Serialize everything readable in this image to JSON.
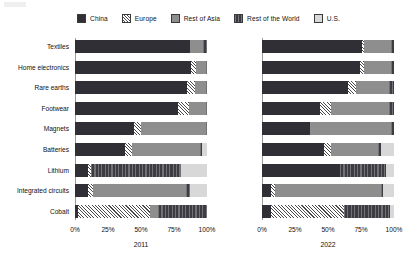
{
  "legend": {
    "position": "top-center",
    "items": [
      {
        "label": "China",
        "key": "china",
        "color": "#2f2f35"
      },
      {
        "label": "Europe",
        "key": "europe",
        "color": "#ffffff"
      },
      {
        "label": "Rest of Asia",
        "key": "roa",
        "color": "#8e8e8e"
      },
      {
        "label": "Rest of the World",
        "key": "row",
        "color": "#3c3c42"
      },
      {
        "label": "U.S.",
        "key": "us",
        "color": "#d8d8d8"
      }
    ]
  },
  "axis": {
    "ticks": [
      "0%",
      "25%",
      "50%",
      "75%",
      "100%"
    ],
    "tick_values": [
      0,
      25,
      50,
      75,
      100
    ],
    "min": 0,
    "max": 100
  },
  "panels": [
    {
      "id": "panel-2011",
      "title": "2011"
    },
    {
      "id": "panel-2022",
      "title": "2022"
    }
  ],
  "chart_data": {
    "type": "bar",
    "orientation": "horizontal",
    "stacked": true,
    "normalized_percent": true,
    "title": "",
    "subtitle": "",
    "xlabel": "",
    "ylabel": "",
    "xlim": [
      0,
      100
    ],
    "grid": false,
    "legend_position": "top-center",
    "series": [
      {
        "name": "China",
        "key": "china"
      },
      {
        "name": "Europe",
        "key": "europe"
      },
      {
        "name": "Rest of Asia",
        "key": "roa"
      },
      {
        "name": "Rest of the World",
        "key": "row"
      },
      {
        "name": "U.S.",
        "key": "us"
      }
    ],
    "categories": [
      "Textiles",
      "Home electronics",
      "Rare earths",
      "Footwear",
      "Magnets",
      "Batteries",
      "Lithium",
      "Integrated circuits",
      "Cobalt"
    ],
    "panels": [
      {
        "name": "2011",
        "rows": [
          {
            "category": "Textiles",
            "china": 87,
            "europe": 0,
            "roa": 10,
            "row": 3,
            "us": 0
          },
          {
            "category": "Home electronics",
            "china": 88,
            "europe": 4,
            "roa": 7,
            "row": 1,
            "us": 0
          },
          {
            "category": "Rare earths",
            "china": 85,
            "europe": 6,
            "roa": 8,
            "row": 1,
            "us": 0
          },
          {
            "category": "Footwear",
            "china": 78,
            "europe": 8,
            "roa": 13,
            "row": 1,
            "us": 0
          },
          {
            "category": "Magnets",
            "china": 45,
            "europe": 5,
            "roa": 49,
            "row": 1,
            "us": 0
          },
          {
            "category": "Batteries",
            "china": 38,
            "europe": 5,
            "roa": 52,
            "row": 1,
            "us": 4
          },
          {
            "category": "Lithium",
            "china": 10,
            "europe": 2,
            "roa": 0,
            "row": 68,
            "us": 20
          },
          {
            "category": "Integrated circuits",
            "china": 10,
            "europe": 4,
            "roa": 70,
            "row": 3,
            "us": 13
          },
          {
            "category": "Cobalt",
            "china": 2,
            "europe": 55,
            "roa": 6,
            "row": 37,
            "us": 0
          }
        ]
      },
      {
        "name": "2022",
        "rows": [
          {
            "category": "Textiles",
            "china": 76,
            "europe": 1,
            "roa": 21,
            "row": 2,
            "us": 0
          },
          {
            "category": "Home electronics",
            "china": 74,
            "europe": 3,
            "roa": 21,
            "row": 2,
            "us": 0
          },
          {
            "category": "Rare earths",
            "china": 65,
            "europe": 6,
            "roa": 25,
            "row": 4,
            "us": 0
          },
          {
            "category": "Footwear",
            "china": 44,
            "europe": 8,
            "roa": 44,
            "row": 4,
            "us": 0
          },
          {
            "category": "Magnets",
            "china": 36,
            "europe": 0,
            "roa": 62,
            "row": 2,
            "us": 0
          },
          {
            "category": "Batteries",
            "china": 47,
            "europe": 5,
            "roa": 36,
            "row": 2,
            "us": 10
          },
          {
            "category": "Lithium",
            "china": 59,
            "europe": 0,
            "roa": 0,
            "row": 35,
            "us": 6
          },
          {
            "category": "Integrated circuits",
            "china": 7,
            "europe": 3,
            "roa": 80,
            "row": 2,
            "us": 8
          },
          {
            "category": "Cobalt",
            "china": 7,
            "europe": 55,
            "roa": 0,
            "row": 35,
            "us": 3
          }
        ]
      }
    ]
  }
}
